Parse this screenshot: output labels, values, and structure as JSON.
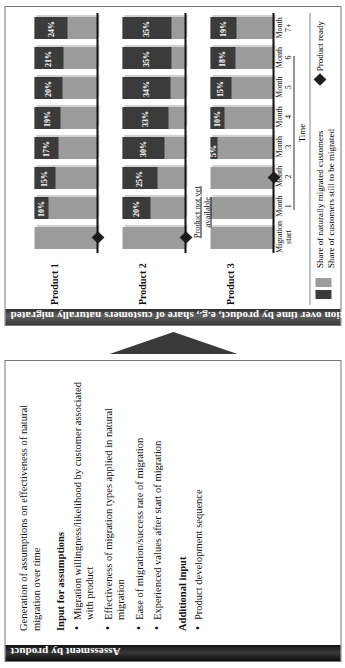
{
  "left_panel": {
    "title": "Assessment by product",
    "lead": "Generation of assumptions on effectiveness of natural migration over time",
    "sections": [
      {
        "heading": "Input for assumptions",
        "items": [
          "Migration willingness/likelihood by customer associated with product",
          "Effectiveness of migration types applied in natural migration",
          "Ease of migration/success rate of migration",
          "Experienced values after start of migration"
        ]
      },
      {
        "heading": "Additional input",
        "items": [
          "Product development sequence"
        ]
      }
    ]
  },
  "arrow": {
    "name": "flow-arrow"
  },
  "chart_panel": {
    "title": "Success rates of natural migration over time by product, e.g., share of customers naturally migrated",
    "not_available_note_line1": "Product not yet",
    "not_available_note_line2": "available",
    "legend": {
      "dark_label": "Share of naturally migrated customers",
      "light_label": "Share of customers still to be migrated",
      "marker_label": "Product ready"
    }
  },
  "chart_data": {
    "type": "bar",
    "subtype": "stacked-100-percent-rows",
    "title": "Success rates of natural migration over time by product, e.g., share of customers naturally migrated",
    "xlabel": "Time",
    "ylabel": "",
    "ylim": [
      0,
      100
    ],
    "grid": false,
    "legend_position": "bottom-left",
    "categories": [
      {
        "l1": "Migration",
        "l2": "start"
      },
      {
        "l1": "Month",
        "l2": "1"
      },
      {
        "l1": "Month",
        "l2": "2"
      },
      {
        "l1": "Month",
        "l2": "3"
      },
      {
        "l1": "Month",
        "l2": "4"
      },
      {
        "l1": "Month",
        "l2": "5"
      },
      {
        "l1": "Month",
        "l2": "6"
      },
      {
        "l1": "Month",
        "l2": "7+"
      }
    ],
    "series": [
      {
        "name": "Product 1",
        "product_ready_index": 0,
        "values": [
          0,
          10,
          15,
          17,
          19,
          20,
          21,
          24
        ],
        "labels": [
          "",
          "10%",
          "15%",
          "17%",
          "19%",
          "20%",
          "21%",
          "24%"
        ],
        "available": [
          true,
          true,
          true,
          true,
          true,
          true,
          true,
          true
        ]
      },
      {
        "name": "Product 2",
        "product_ready_index": 0,
        "values": [
          0,
          20,
          25,
          30,
          33,
          34,
          35,
          35
        ],
        "labels": [
          "",
          "20%",
          "25%",
          "30%",
          "33%",
          "34%",
          "35%",
          "35%"
        ],
        "available": [
          true,
          true,
          true,
          true,
          true,
          true,
          true,
          true
        ]
      },
      {
        "name": "Product 3",
        "product_ready_index": 2,
        "values": [
          0,
          0,
          0,
          5,
          10,
          15,
          18,
          19
        ],
        "labels": [
          "",
          "",
          "",
          "5%",
          "10%",
          "15%",
          "18%",
          "19%"
        ],
        "available": [
          false,
          false,
          false,
          true,
          true,
          true,
          true,
          true
        ]
      }
    ],
    "legend_entries": [
      {
        "label": "Share of naturally migrated customers",
        "color": "#3b3b3b"
      },
      {
        "label": "Share of customers still to be migrated",
        "color": "#9c9c9c"
      },
      {
        "label": "Product ready",
        "color": "#1d1d1d",
        "marker": "diamond"
      }
    ],
    "annotations": [
      {
        "text": "Product not yet available",
        "series": "Product 3",
        "span": [
          0,
          2
        ]
      }
    ],
    "colors": {
      "migrated": "#3b3b3b",
      "remaining": "#9c9c9c",
      "marker": "#1d1d1d",
      "title_band": "#3a3a3a",
      "panel_band": "#111111"
    }
  }
}
